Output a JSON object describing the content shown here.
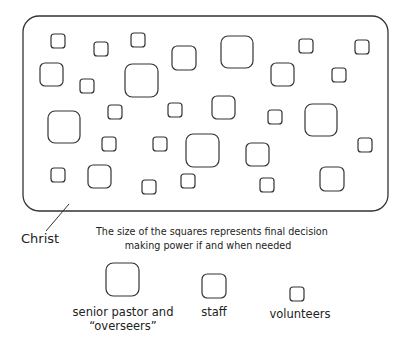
{
  "diagram": {
    "frame": {
      "label": "Christ",
      "x": 23,
      "y": 16,
      "w": 365,
      "h": 195,
      "r": 16
    },
    "pointer_line": {
      "x1": 69,
      "y1": 204,
      "x2": 46,
      "y2": 231
    },
    "stroke_color": "#333333",
    "squares": [
      {
        "x": 51,
        "y": 34,
        "s": 14
      },
      {
        "x": 94,
        "y": 42,
        "s": 14
      },
      {
        "x": 131,
        "y": 33,
        "s": 14
      },
      {
        "x": 172,
        "y": 46,
        "s": 24
      },
      {
        "x": 221,
        "y": 36,
        "s": 32
      },
      {
        "x": 299,
        "y": 39,
        "s": 14
      },
      {
        "x": 355,
        "y": 40,
        "s": 14
      },
      {
        "x": 40,
        "y": 63,
        "s": 23
      },
      {
        "x": 80,
        "y": 79,
        "s": 14
      },
      {
        "x": 125,
        "y": 64,
        "s": 33
      },
      {
        "x": 271,
        "y": 63,
        "s": 23
      },
      {
        "x": 332,
        "y": 68,
        "s": 14
      },
      {
        "x": 48,
        "y": 111,
        "s": 32
      },
      {
        "x": 108,
        "y": 105,
        "s": 14
      },
      {
        "x": 168,
        "y": 103,
        "s": 14
      },
      {
        "x": 212,
        "y": 96,
        "s": 23
      },
      {
        "x": 268,
        "y": 110,
        "s": 14
      },
      {
        "x": 305,
        "y": 104,
        "s": 32
      },
      {
        "x": 102,
        "y": 137,
        "s": 14
      },
      {
        "x": 153,
        "y": 137,
        "s": 14
      },
      {
        "x": 186,
        "y": 134,
        "s": 33
      },
      {
        "x": 246,
        "y": 143,
        "s": 23
      },
      {
        "x": 358,
        "y": 138,
        "s": 14
      },
      {
        "x": 51,
        "y": 168,
        "s": 14
      },
      {
        "x": 88,
        "y": 165,
        "s": 23
      },
      {
        "x": 142,
        "y": 180,
        "s": 14
      },
      {
        "x": 181,
        "y": 174,
        "s": 14
      },
      {
        "x": 260,
        "y": 178,
        "s": 14
      },
      {
        "x": 320,
        "y": 167,
        "s": 24
      }
    ]
  },
  "labels": {
    "christ": "Christ",
    "caption_line1": "The size of the squares represents final decision",
    "caption_line2": "making power if and when needed"
  },
  "legend": [
    {
      "label_line1": "senior pastor and",
      "label_line2": "“overseers”",
      "x": 106,
      "y": 263,
      "s": 33
    },
    {
      "label_line1": "staff",
      "label_line2": "",
      "x": 202,
      "y": 274,
      "s": 24
    },
    {
      "label_line1": "volunteers",
      "label_line2": "",
      "x": 290,
      "y": 287,
      "s": 14
    }
  ]
}
